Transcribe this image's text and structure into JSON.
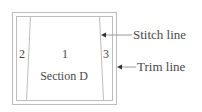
{
  "diagram": {
    "title": "Section D",
    "sections": [
      {
        "id": "1",
        "label": "1"
      },
      {
        "id": "2",
        "label": "2"
      },
      {
        "id": "3",
        "label": "3"
      }
    ],
    "section_name": "Section D",
    "callouts": [
      {
        "label": "Stitch line",
        "points_to": "stitch-line"
      },
      {
        "label": "Trim line",
        "points_to": "trim-line"
      }
    ],
    "colors": {
      "line": "#bdbdbd",
      "text": "#4a4a4a",
      "arrow": "#333333"
    }
  }
}
